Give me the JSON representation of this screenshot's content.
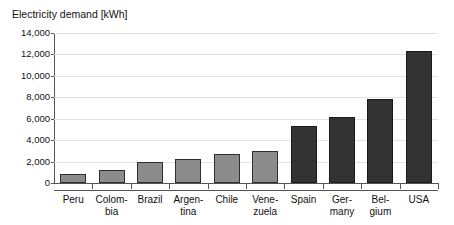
{
  "chart_data": {
    "type": "bar",
    "title": "Electricity demand [kWh]",
    "xlabel": "",
    "ylabel": "",
    "ylim": [
      0,
      14000
    ],
    "ytick_step": 2000,
    "ytick_labels": [
      "14,000",
      "12,000",
      "10,000",
      "8,000",
      "6,000",
      "4,000",
      "2,000",
      "0"
    ],
    "ytick_values": [
      14000,
      12000,
      10000,
      8000,
      6000,
      4000,
      2000,
      0
    ],
    "grid": true,
    "legend": "none",
    "categories": [
      "Peru",
      "Colombia",
      "Brazil",
      "Argentina",
      "Chile",
      "Venezuela",
      "Spain",
      "Germany",
      "Belgium",
      "USA"
    ],
    "category_label_lines": [
      [
        "Peru",
        ""
      ],
      [
        "Colom-",
        "bia"
      ],
      [
        "Brazil",
        ""
      ],
      [
        "Argen-",
        "tina"
      ],
      [
        "Chile",
        ""
      ],
      [
        "Vene-",
        "zuela"
      ],
      [
        "Spain",
        ""
      ],
      [
        "Ger-",
        "many"
      ],
      [
        "Bel-",
        "gium"
      ],
      [
        "USA",
        ""
      ]
    ],
    "values": [
      800,
      1200,
      2000,
      2200,
      2700,
      3000,
      5300,
      6200,
      7800,
      12300
    ],
    "bar_styles": [
      "light",
      "light",
      "light",
      "light",
      "light",
      "light",
      "dark",
      "dark",
      "dark",
      "dark"
    ],
    "colors": {
      "light_bar": "#8c8c8c",
      "dark_bar": "#333333",
      "bar_border": "#2e2e2e",
      "gridline": "#e2e2e2",
      "axis": "#555555",
      "text": "#111111",
      "background": "#ffffff"
    }
  }
}
